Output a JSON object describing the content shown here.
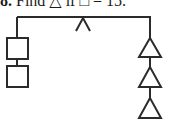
{
  "question": {
    "number": "8.",
    "text": "Find △ if □ = 15."
  },
  "diagram": {
    "type": "balance-mobile",
    "left_side": {
      "shape": "square",
      "count": 2
    },
    "right_side": {
      "shape": "triangle",
      "count": 3
    },
    "fulcrum": "caret",
    "stroke_color": "#2b2b2b"
  }
}
